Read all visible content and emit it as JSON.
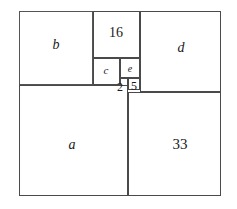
{
  "figure": {
    "background_color": "#ffffff",
    "line_color": "#4a4a4a",
    "text_color": "#1a1a1a",
    "frame": {
      "x": 19,
      "y": 11,
      "width": 202,
      "height": 185
    }
  },
  "chart_data": {
    "type": "diagram",
    "subtype": "squared-rectangle-dissection",
    "title": "",
    "xlabel": "",
    "ylabel": "",
    "units": "pixels",
    "bounding_box": {
      "x": 19,
      "y": 11,
      "width": 202,
      "height": 185
    },
    "squares": [
      {
        "id": "b",
        "label": "b",
        "label_style": "italic",
        "x": 19,
        "y": 11,
        "width": 74,
        "height": 74,
        "label_x": 56,
        "label_y": 45
      },
      {
        "id": "16",
        "label": "16",
        "label_style": "roman",
        "x": 93,
        "y": 11,
        "width": 47,
        "height": 47,
        "label_x": 116,
        "label_y": 33
      },
      {
        "id": "d",
        "label": "d",
        "label_style": "italic",
        "x": 140,
        "y": 11,
        "width": 81,
        "height": 81,
        "label_x": 181,
        "label_y": 48
      },
      {
        "id": "c",
        "label": "c",
        "label_style": "italic",
        "x": 93,
        "y": 58,
        "width": 27,
        "height": 27,
        "label_x": 106,
        "label_y": 70
      },
      {
        "id": "e",
        "label": "e",
        "label_style": "italic",
        "x": 120,
        "y": 58,
        "width": 20,
        "height": 20,
        "label_x": 130,
        "label_y": 69
      },
      {
        "id": "2",
        "label": "2",
        "label_style": "roman",
        "x": 120,
        "y": 78,
        "width": 8,
        "height": 8,
        "label_x": 120,
        "label_y": 87
      },
      {
        "id": "5",
        "label": "5",
        "label_style": "roman",
        "x": 128,
        "y": 78,
        "width": 12,
        "height": 12,
        "label_x": 134,
        "label_y": 86
      },
      {
        "id": "a",
        "label": "a",
        "label_style": "italic",
        "x": 19,
        "y": 85,
        "width": 109,
        "height": 111,
        "label_x": 72,
        "label_y": 145
      },
      {
        "id": "33",
        "label": "33",
        "label_style": "roman",
        "x": 128,
        "y": 92,
        "width": 93,
        "height": 104,
        "label_x": 180,
        "label_y": 144
      }
    ],
    "labels": [
      "b",
      "16",
      "d",
      "c",
      "e",
      "2",
      "5",
      "a",
      "33"
    ],
    "known_values": {
      "16": 16,
      "2": 2,
      "5": 5,
      "33": 33
    },
    "unknown_values": [
      "a",
      "b",
      "c",
      "d",
      "e"
    ]
  }
}
